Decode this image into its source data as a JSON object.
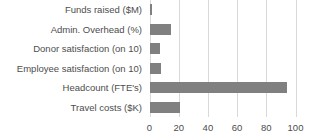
{
  "chart_data": {
    "type": "bar",
    "orientation": "horizontal",
    "title": "",
    "subtitle": "",
    "xlabel": "",
    "ylabel": "",
    "categories": [
      "Funds raised ($M)",
      "Admin. Overhead (%)",
      "Donor satisfaction (on 10)",
      "Employee satisfaction (on 10)",
      "Headcount (FTE's)",
      "Travel costs ($K)"
    ],
    "values": [
      1.5,
      15,
      7,
      8,
      94.5,
      21
    ],
    "series": [
      {
        "name": "Value",
        "values": [
          1.5,
          15,
          7,
          8,
          94.5,
          21
        ]
      }
    ],
    "xlim": [
      0,
      100
    ],
    "ylim": null,
    "xticks": [
      0,
      20,
      40,
      60,
      80,
      100
    ],
    "xtick_labels": [
      "0",
      "20",
      "40",
      "60",
      "80",
      "100"
    ],
    "grid": true,
    "grid_axis": "x",
    "legend": false,
    "legend_position": "none",
    "annotations": [],
    "colors": {
      "bar": "#808080",
      "gridline": "#d9d9d9",
      "text": "#4d4d4d",
      "background": "#ffffff"
    }
  }
}
